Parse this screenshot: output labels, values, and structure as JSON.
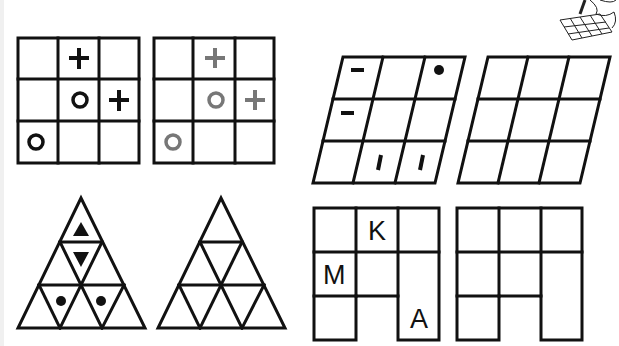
{
  "puzzles": [
    {
      "id": "square-grid",
      "type": "3x3 square grid",
      "original": {
        "cells": [
          [
            "",
            "+",
            ""
          ],
          [
            "",
            "o",
            "+"
          ],
          [
            "o",
            "",
            ""
          ]
        ]
      },
      "copy": {
        "cells": [
          [
            "",
            "+",
            ""
          ],
          [
            "",
            "o",
            "+"
          ],
          [
            "o",
            "",
            ""
          ]
        ],
        "symbol_color": "#777777"
      },
      "symbol_color": "#111111"
    },
    {
      "id": "slanted-grid",
      "type": "3x3 parallelogram grid",
      "original": {
        "cells": [
          [
            "dash",
            "",
            "dot"
          ],
          [
            "dash",
            "",
            ""
          ],
          [
            "",
            "bar",
            "bar"
          ]
        ]
      },
      "copy": {
        "cells": [
          [
            "",
            "",
            ""
          ],
          [
            "",
            "",
            ""
          ],
          [
            "",
            "",
            ""
          ]
        ]
      }
    },
    {
      "id": "triangle-grid",
      "type": "9-cell triangle",
      "original": {
        "marks": [
          "up-triangle (top)",
          "down-triangle (middle)",
          "dot (bottom-left inverted)",
          "dot (bottom-right inverted)"
        ]
      },
      "copy": {
        "marks": []
      }
    },
    {
      "id": "letter-grid",
      "type": "3x3 grid missing bottom-middle",
      "original": {
        "cells": [
          [
            "",
            "K",
            ""
          ],
          [
            "M",
            "",
            ""
          ],
          [
            "",
            "-",
            "A"
          ]
        ]
      },
      "copy": {
        "cells": [
          [
            "",
            "",
            ""
          ],
          [
            "",
            "",
            ""
          ],
          [
            "",
            "-",
            ""
          ]
        ]
      },
      "letters": {
        "k": "K",
        "m": "M",
        "a": "A"
      }
    }
  ],
  "decoration": {
    "icon": "hand-drawing-grid-icon"
  }
}
